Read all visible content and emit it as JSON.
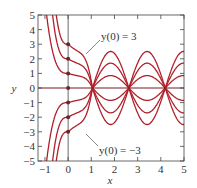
{
  "chart_data": {
    "type": "line",
    "title": "",
    "xlabel": "x",
    "ylabel": "y",
    "xlim": [
      -1.3,
      5
    ],
    "ylim": [
      -5,
      5
    ],
    "xticks": [
      -1,
      0,
      1,
      2,
      3,
      4,
      5
    ],
    "yticks": [
      -5,
      -4,
      -3,
      -2,
      -1,
      0,
      1,
      2,
      3,
      4,
      5
    ],
    "grid": false,
    "series": [
      {
        "name": "y(0)=3",
        "y0": 3,
        "amplitude": 2.5
      },
      {
        "name": "y(0)=2",
        "y0": 2,
        "amplitude": 1.7
      },
      {
        "name": "y(0)=1",
        "y0": 1,
        "amplitude": 0.85
      },
      {
        "name": "y(0)=0",
        "y0": 0,
        "amplitude": 0
      },
      {
        "name": "y(0)=-1",
        "y0": -1,
        "amplitude": 0.85
      },
      {
        "name": "y(0)=-2",
        "y0": -2,
        "amplitude": 1.7
      },
      {
        "name": "y(0)=-3",
        "y0": -3,
        "amplitude": 2.5
      }
    ],
    "common_zeros_x": [
      1.05,
      2.6,
      4.2
    ],
    "annotations": [
      {
        "text": "y(0) = 3",
        "x": 1.4,
        "y": 3.5
      },
      {
        "text": "y(0) = −3",
        "x": 1.4,
        "y": -3.9
      }
    ],
    "line_color": "#b0202a",
    "initial_points": [
      3,
      2,
      1,
      0,
      -1,
      -2,
      -3
    ]
  }
}
